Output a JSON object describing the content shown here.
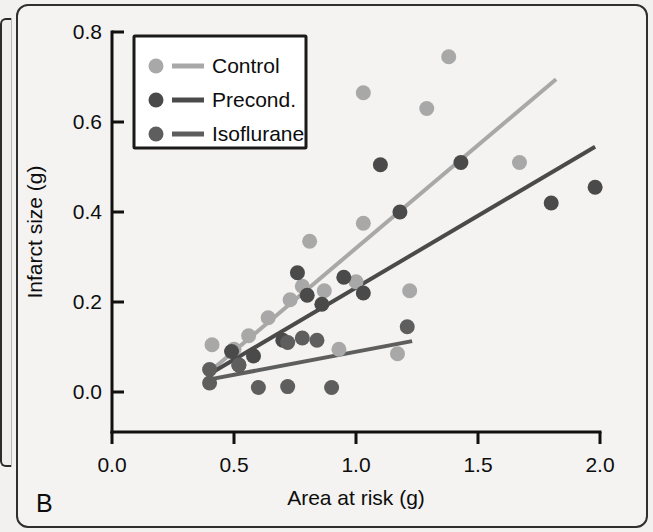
{
  "panel": {
    "label": "B"
  },
  "chart_data": {
    "type": "scatter",
    "title": "",
    "xlabel": "Area at risk (g)",
    "ylabel": "Infarct size (g)",
    "xlim": [
      0.0,
      2.0
    ],
    "ylim": [
      0.0,
      0.8
    ],
    "xticks": [
      "0.0",
      "0.5",
      "1.0",
      "1.5",
      "2.0"
    ],
    "xtick_values": [
      0.0,
      0.5,
      1.0,
      1.5,
      2.0
    ],
    "yticks": [
      "0.0",
      "0.2",
      "0.4",
      "0.6",
      "0.8"
    ],
    "ytick_values": [
      0.0,
      0.2,
      0.4,
      0.6,
      0.8
    ],
    "grid": false,
    "legend_position": "top-left",
    "colors": {
      "control": "#a8a8a8",
      "precond": "#4a4a4a",
      "isoflurane": "#5e5e5e"
    },
    "series": [
      {
        "name": "Control",
        "color": "#a8a8a8",
        "points": [
          [
            0.41,
            0.105
          ],
          [
            0.5,
            0.095
          ],
          [
            0.56,
            0.125
          ],
          [
            0.64,
            0.165
          ],
          [
            0.73,
            0.205
          ],
          [
            0.78,
            0.235
          ],
          [
            0.81,
            0.335
          ],
          [
            0.87,
            0.225
          ],
          [
            0.93,
            0.095
          ],
          [
            1.0,
            0.245
          ],
          [
            1.03,
            0.375
          ],
          [
            1.03,
            0.665
          ],
          [
            1.17,
            0.085
          ],
          [
            1.22,
            0.225
          ],
          [
            1.29,
            0.63
          ],
          [
            1.38,
            0.745
          ],
          [
            1.67,
            0.51
          ]
        ],
        "fit": {
          "x0": 0.4,
          "y0": 0.045,
          "x1": 1.82,
          "y1": 0.695
        }
      },
      {
        "name": "Precond.",
        "color": "#4a4a4a",
        "points": [
          [
            0.49,
            0.09
          ],
          [
            0.52,
            0.06
          ],
          [
            0.58,
            0.08
          ],
          [
            0.7,
            0.115
          ],
          [
            0.76,
            0.265
          ],
          [
            0.8,
            0.215
          ],
          [
            0.86,
            0.195
          ],
          [
            0.95,
            0.255
          ],
          [
            1.03,
            0.22
          ],
          [
            1.1,
            0.505
          ],
          [
            1.18,
            0.4
          ],
          [
            1.43,
            0.51
          ],
          [
            1.8,
            0.42
          ],
          [
            1.98,
            0.455
          ]
        ],
        "fit": {
          "x0": 0.4,
          "y0": 0.04,
          "x1": 1.98,
          "y1": 0.545
        }
      },
      {
        "name": "Isoflurane",
        "color": "#5e5e5e",
        "points": [
          [
            0.4,
            0.05
          ],
          [
            0.4,
            0.02
          ],
          [
            0.52,
            0.06
          ],
          [
            0.6,
            0.01
          ],
          [
            0.72,
            0.11
          ],
          [
            0.72,
            0.012
          ],
          [
            0.78,
            0.12
          ],
          [
            0.84,
            0.115
          ],
          [
            0.9,
            0.01
          ],
          [
            1.21,
            0.145
          ]
        ],
        "fit": {
          "x0": 0.4,
          "y0": 0.028,
          "x1": 1.23,
          "y1": 0.113
        }
      }
    ]
  },
  "legend": {
    "entries": [
      {
        "label": "Control",
        "color": "#a8a8a8"
      },
      {
        "label": "Precond.",
        "color": "#4a4a4a"
      },
      {
        "label": "Isoflurane",
        "color": "#5e5e5e"
      }
    ]
  }
}
